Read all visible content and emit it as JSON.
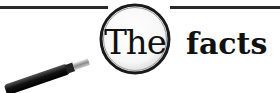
{
  "banner": {
    "lens_text": "The",
    "trailing_text": "facts",
    "icon": "magnifying-glass-icon",
    "colors": {
      "ink": "#111111",
      "rule": "#2a2a2a",
      "background": "#ffffff"
    }
  }
}
